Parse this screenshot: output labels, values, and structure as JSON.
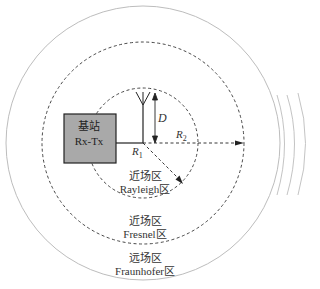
{
  "diagram": {
    "base_station": {
      "line1": "基站",
      "line2": "Rx-Tx"
    },
    "labels": {
      "D": "D",
      "R1": "R",
      "R1_sub": "1",
      "R2": "R",
      "R2_sub": "2"
    },
    "zones": {
      "rayleigh": {
        "line1": "近场区",
        "line2": "Rayleigh区"
      },
      "fresnel": {
        "line1": "近场区",
        "line2": "Fresnel区"
      },
      "fraunhofer": {
        "line1": "远场区",
        "line2": "Fraunhofer区"
      }
    },
    "colors": {
      "box_fill": "#a9a9a9",
      "line": "#222222",
      "outer_circle": "#bbbbbb"
    }
  }
}
